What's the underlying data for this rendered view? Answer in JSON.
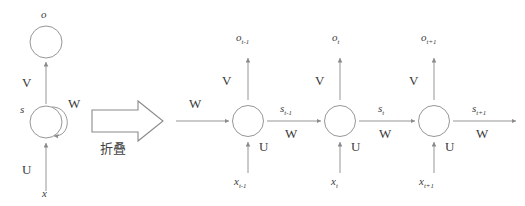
{
  "figure": {
    "language_note": "Chinese caption under the transform arrow",
    "stroke_color": "#8a8a8a",
    "text_color": "#3a3a3a",
    "background": "#ffffff"
  },
  "folded": {
    "output_label": "o",
    "state_label": "s",
    "input_label": "x",
    "weight_output": "V",
    "weight_recurrent": "W",
    "weight_input": "U",
    "self_loop_icon": "recurrent-loop-arrow"
  },
  "transform": {
    "arrow_icon": "block-right-arrow",
    "caption": "折叠"
  },
  "unfolded": {
    "incoming_weight": "W",
    "steps": [
      {
        "output_label": "o",
        "output_sub": "t-1",
        "input_label": "x",
        "input_sub": "t-1",
        "weight_output": "V",
        "weight_input": "U",
        "state_label": "s",
        "state_sub": "t-1",
        "weight_recurrent": "W"
      },
      {
        "output_label": "o",
        "output_sub": "t",
        "input_label": "x",
        "input_sub": "t",
        "weight_output": "V",
        "weight_input": "U",
        "state_label": "s",
        "state_sub": "t",
        "weight_recurrent": "W"
      },
      {
        "output_label": "o",
        "output_sub": "t+1",
        "input_label": "x",
        "input_sub": "t+1",
        "weight_output": "V",
        "weight_input": "U",
        "state_label": "s",
        "state_sub": "t+1",
        "weight_recurrent": "W"
      }
    ]
  }
}
